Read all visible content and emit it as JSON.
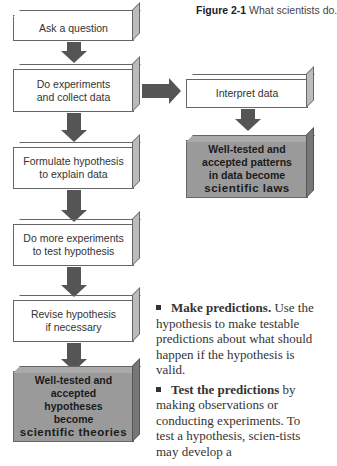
{
  "caption": {
    "label": "Figure 2-1",
    "text": "What scientists do."
  },
  "flow_left": [
    {
      "lines": [
        "Ask a question"
      ]
    },
    {
      "lines": [
        "Do experiments",
        "and collect data"
      ]
    },
    {
      "lines": [
        "Formulate hypothesis",
        "to explain data"
      ]
    },
    {
      "lines": [
        "Do more experiments",
        "to test hypothesis"
      ]
    },
    {
      "lines": [
        "Revise hypothesis",
        "if necessary"
      ]
    }
  ],
  "theories_box": {
    "lines": [
      "Well-tested and",
      "accepted",
      "hypotheses",
      "become"
    ],
    "emphasis": "scientific theories"
  },
  "flow_right": {
    "interpret": "Interpret data"
  },
  "laws_box": {
    "lines": [
      "Well-tested and",
      "accepted patterns",
      "in data become"
    ],
    "emphasis": "scientific laws"
  },
  "body_text": [
    {
      "bold": "Make predictions.",
      "rest": " Use the hypothesis to make testable predictions about what should happen if the hypothesis is valid."
    },
    {
      "bold": "Test the predictions",
      "rest": " by making observations or conducting experiments. To test a hypothesis, scien-tists may develop a"
    }
  ]
}
